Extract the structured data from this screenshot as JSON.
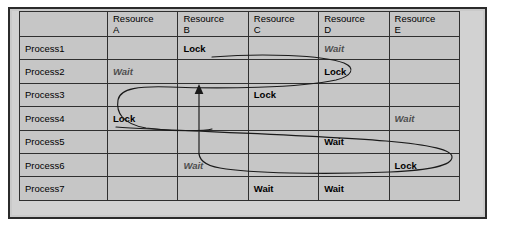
{
  "diagram": {
    "type": "resource-allocation-deadlock-table",
    "background_color": "#ffffff",
    "plate_color": "#d2d2d2",
    "cell_color": "#c6c6c6",
    "border_color": "#2f2f2f",
    "curve_color": "#1a1a1a"
  },
  "table": {
    "corner_label": "",
    "column_headers": [
      {
        "name": "Resource",
        "letter": "A"
      },
      {
        "name": "Resource",
        "letter": "B"
      },
      {
        "name": "Resource",
        "letter": "C"
      },
      {
        "name": "Resource",
        "letter": "D"
      },
      {
        "name": "Resource",
        "letter": "E"
      }
    ],
    "rows": [
      {
        "process": "Process1",
        "cells": [
          {
            "text": "",
            "style": "empty"
          },
          {
            "text": "Lock",
            "style": "lock"
          },
          {
            "text": "",
            "style": "empty"
          },
          {
            "text": "Wait",
            "style": "wait-italic"
          },
          {
            "text": "",
            "style": "empty"
          }
        ]
      },
      {
        "process": "Process2",
        "cells": [
          {
            "text": "Wait",
            "style": "wait-italic"
          },
          {
            "text": "",
            "style": "empty"
          },
          {
            "text": "",
            "style": "empty"
          },
          {
            "text": "Lock",
            "style": "lock"
          },
          {
            "text": "",
            "style": "empty"
          }
        ]
      },
      {
        "process": "Process3",
        "cells": [
          {
            "text": "",
            "style": "empty"
          },
          {
            "text": "",
            "style": "empty"
          },
          {
            "text": "Lock",
            "style": "lock"
          },
          {
            "text": "",
            "style": "empty"
          },
          {
            "text": "",
            "style": "empty"
          }
        ]
      },
      {
        "process": "Process4",
        "cells": [
          {
            "text": "Lock",
            "style": "lock"
          },
          {
            "text": "",
            "style": "empty"
          },
          {
            "text": "",
            "style": "empty"
          },
          {
            "text": "",
            "style": "empty"
          },
          {
            "text": "Wait",
            "style": "wait-italic"
          }
        ]
      },
      {
        "process": "Process5",
        "cells": [
          {
            "text": "",
            "style": "empty"
          },
          {
            "text": "",
            "style": "empty"
          },
          {
            "text": "",
            "style": "empty"
          },
          {
            "text": "Wait",
            "style": "wait-bold"
          },
          {
            "text": "",
            "style": "empty"
          }
        ]
      },
      {
        "process": "Process6",
        "cells": [
          {
            "text": "",
            "style": "empty"
          },
          {
            "text": "Wait",
            "style": "wait-italic"
          },
          {
            "text": "",
            "style": "empty"
          },
          {
            "text": "",
            "style": "empty"
          },
          {
            "text": "Lock",
            "style": "lock"
          }
        ]
      },
      {
        "process": "Process7",
        "cells": [
          {
            "text": "",
            "style": "empty"
          },
          {
            "text": "",
            "style": "empty"
          },
          {
            "text": "Wait",
            "style": "wait-bold"
          },
          {
            "text": "Wait",
            "style": "wait-bold"
          },
          {
            "text": "",
            "style": "empty"
          }
        ]
      }
    ]
  },
  "annotations": {
    "cycles": [
      {
        "name": "upper-cycle",
        "description": "Loop from Process1 Lock on Resource B through Resource D region back around Resource A to Process4 Lock"
      },
      {
        "name": "lower-cycle",
        "description": "Loop from Process4 Lock on Resource A rightwards around Resource E to Process6 Wait on Resource B, arrow pointing up to Resource B"
      }
    ],
    "arrowhead": {
      "name": "arrow-up",
      "direction": "up",
      "target_column": "Resource B",
      "target_row": "between Process2 and Process3"
    }
  }
}
